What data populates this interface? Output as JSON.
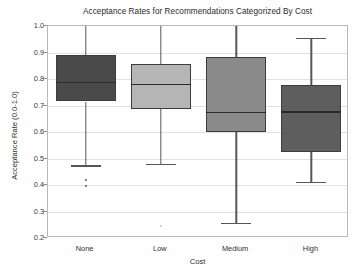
{
  "chart_data": {
    "type": "box",
    "title": "Acceptance Rates for Recommendations Categorized By Cost",
    "xlabel": "Cost",
    "ylabel": "Acceptance Rate (0.0-1.0)",
    "categories": [
      "None",
      "Low",
      "Medium",
      "High"
    ],
    "ylim": [
      0.2,
      1.0
    ],
    "ytick_labels": [
      "0.2",
      "0.3",
      "0.4",
      "0.5",
      "0.6",
      "0.7",
      "0.8",
      "0.9",
      "1.0"
    ],
    "ytick_values": [
      0.2,
      0.3,
      0.4,
      0.5,
      0.6,
      0.7,
      0.8,
      0.9,
      1.0
    ],
    "grid": true,
    "legend": "none",
    "boxes": [
      {
        "category": "None",
        "whisker_low": 0.475,
        "q1": 0.715,
        "median": 0.79,
        "q3": 0.89,
        "whisker_high": 1.0,
        "outliers": [
          0.42,
          0.395
        ],
        "fill": "#4a4a4a"
      },
      {
        "category": "Low",
        "whisker_low": 0.48,
        "q1": 0.687,
        "median": 0.783,
        "q3": 0.857,
        "whisker_high": 1.0,
        "outliers": [
          0.245
        ],
        "fill": "#b5b5b5"
      },
      {
        "category": "Medium",
        "whisker_low": 0.258,
        "q1": 0.6,
        "median": 0.677,
        "q3": 0.885,
        "whisker_high": 1.0,
        "outliers": [],
        "fill": "#8a8a8a"
      },
      {
        "category": "High",
        "whisker_low": 0.412,
        "q1": 0.523,
        "median": 0.678,
        "q3": 0.777,
        "whisker_high": 0.955,
        "outliers": [],
        "fill": "#5e5e5e"
      }
    ]
  }
}
